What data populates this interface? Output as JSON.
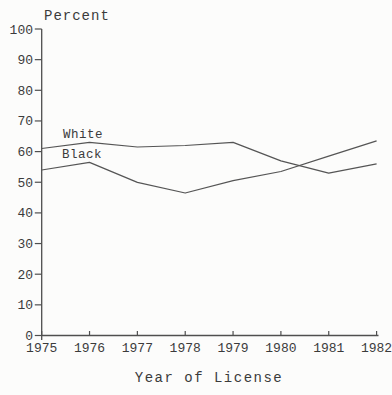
{
  "page": {
    "background": "#fcfcfb",
    "text_color": "#3b3b3b",
    "line_color": "#555555"
  },
  "chart_data": {
    "type": "line",
    "title": "",
    "ylabel": "Percent",
    "xlabel": "Year of License",
    "x": [
      1975,
      1976,
      1977,
      1978,
      1979,
      1980,
      1981,
      1982
    ],
    "x_tick_labels": [
      "1975",
      "1976",
      "1977",
      "1978",
      "1979",
      "1980",
      "1981",
      "1982"
    ],
    "y_ticks": [
      0,
      10,
      20,
      30,
      40,
      50,
      60,
      70,
      80,
      90,
      100
    ],
    "y_tick_labels": [
      "0",
      "10",
      "20",
      "30",
      "40",
      "50",
      "60",
      "70",
      "80",
      "90",
      "100"
    ],
    "ylim": [
      0,
      100
    ],
    "grid": false,
    "legend_position": "inline-labels-near-lines",
    "series": [
      {
        "name": "White",
        "values": [
          61,
          63,
          61.5,
          62,
          63,
          57,
          53,
          56
        ]
      },
      {
        "name": "Black",
        "values": [
          54,
          56.5,
          50,
          46.5,
          50.5,
          53.5,
          58.5,
          63.5
        ]
      }
    ]
  }
}
